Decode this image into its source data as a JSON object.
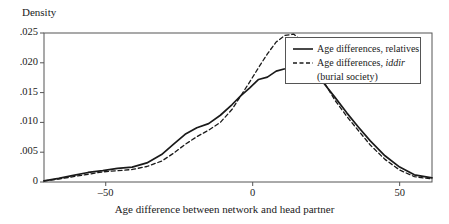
{
  "chart_data": {
    "type": "line",
    "title": "",
    "xlabel": "Age difference between network and head partner",
    "ylabel": "Density",
    "xlim": [
      -71,
      61
    ],
    "ylim": [
      0,
      0.025
    ],
    "grid": false,
    "legend_position": "top-right",
    "xticks": [
      -50,
      0,
      50
    ],
    "xtick_labels": [
      "–50",
      "0",
      "50"
    ],
    "yticks": [
      0,
      0.005,
      0.01,
      0.015,
      0.02,
      0.025
    ],
    "ytick_labels": [
      "0",
      ".005",
      ".010",
      ".015",
      ".020",
      ".025"
    ],
    "series": [
      {
        "name": "Age differences, relatives",
        "style": "solid",
        "color": "#1a1a1a",
        "x": [
          -71,
          -66,
          -61,
          -56,
          -51,
          -46,
          -41,
          -36,
          -31,
          -27,
          -23,
          -19,
          -15,
          -11,
          -7,
          -4,
          -1,
          2,
          5,
          8,
          11,
          14,
          17,
          20,
          24,
          28,
          32,
          36,
          40,
          45,
          50,
          55,
          61
        ],
        "y": [
          0.0002,
          0.0006,
          0.0011,
          0.0016,
          0.0019,
          0.0023,
          0.0025,
          0.0032,
          0.0046,
          0.0063,
          0.008,
          0.0091,
          0.0098,
          0.0112,
          0.013,
          0.0145,
          0.0158,
          0.0172,
          0.0176,
          0.0186,
          0.019,
          0.0195,
          0.0194,
          0.0188,
          0.0167,
          0.0142,
          0.0116,
          0.0092,
          0.0069,
          0.0044,
          0.0025,
          0.0012,
          0.0007
        ]
      },
      {
        "name": "Age differences, iddir (burial society)",
        "style": "dashed",
        "color": "#1a1a1a",
        "x": [
          -71,
          -66,
          -61,
          -56,
          -51,
          -46,
          -41,
          -36,
          -31,
          -27,
          -23,
          -19,
          -15,
          -11,
          -7,
          -4,
          -1,
          2,
          5,
          8,
          11,
          14,
          17,
          20,
          24,
          28,
          32,
          36,
          40,
          45,
          50,
          55,
          61
        ],
        "y": [
          0.0002,
          0.0005,
          0.0009,
          0.0013,
          0.0017,
          0.0019,
          0.0021,
          0.0026,
          0.0035,
          0.0048,
          0.0063,
          0.0076,
          0.0087,
          0.01,
          0.0122,
          0.0145,
          0.0168,
          0.0192,
          0.0215,
          0.0235,
          0.0246,
          0.0248,
          0.0236,
          0.021,
          0.017,
          0.0137,
          0.011,
          0.0086,
          0.0062,
          0.0038,
          0.002,
          0.0009,
          0.0005
        ]
      }
    ],
    "legend": [
      {
        "label_prefix": "Age differences, relatives",
        "label_italic": "",
        "label_suffix": "",
        "continuation": "",
        "style": "solid"
      },
      {
        "label_prefix": "Age differences, ",
        "label_italic": "iddir",
        "label_suffix": "",
        "continuation": "(burial society)",
        "style": "dashed"
      }
    ]
  },
  "axes": {
    "y_title": "Density",
    "x_title": "Age difference between network and head partner"
  },
  "colors": {
    "line": "#1a1a1a",
    "frame": "#555555",
    "background": "#ffffff"
  }
}
